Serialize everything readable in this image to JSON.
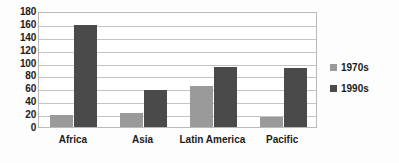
{
  "chart_data": {
    "type": "bar",
    "title": "",
    "subtitle": "",
    "xlabel": "",
    "ylabel": "",
    "categories": [
      "Africa",
      "Asia",
      "Latin America",
      "Pacific"
    ],
    "series": [
      {
        "name": "1970s",
        "color": "#9a9a9a",
        "values": [
          19,
          21,
          63,
          15
        ]
      },
      {
        "name": "1990s",
        "color": "#4a4a4a",
        "values": [
          159,
          57,
          93,
          92
        ]
      }
    ],
    "ylim": [
      0,
      180
    ],
    "ytick_step": 20,
    "yticks": [
      0,
      20,
      40,
      60,
      80,
      100,
      120,
      140,
      160,
      180
    ],
    "ytick_labels": [
      "0",
      "20",
      "40",
      "60",
      "80",
      "100",
      "120",
      "140",
      "160",
      "180"
    ],
    "grid": {
      "horizontal": true,
      "vertical": false,
      "color": "#c4c4c4"
    },
    "legend": {
      "position": "right",
      "entries": [
        {
          "label": "1970s",
          "color": "#9a9a9a"
        },
        {
          "label": "1990s",
          "color": "#4a4a4a"
        }
      ]
    },
    "plot_background": "#ffffff",
    "border_color": "#b9b9b9"
  }
}
